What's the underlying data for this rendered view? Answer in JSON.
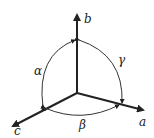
{
  "diagram": {
    "axes": [
      {
        "name": "a",
        "label": "a"
      },
      {
        "name": "b",
        "label": "b"
      },
      {
        "name": "c",
        "label": "c"
      }
    ],
    "angles": [
      {
        "name": "alpha",
        "label": "α",
        "between": [
          "b",
          "c"
        ]
      },
      {
        "name": "beta",
        "label": "β",
        "between": [
          "c",
          "a"
        ]
      },
      {
        "name": "gamma",
        "label": "γ",
        "between": [
          "a",
          "b"
        ]
      }
    ],
    "colors": {
      "stroke": "#222222",
      "background": "#ffffff"
    }
  }
}
